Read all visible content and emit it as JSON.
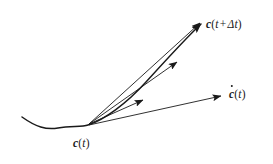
{
  "figure": {
    "background_color": "#ffffff",
    "stroke_color": "#1a1a1a",
    "width": 273,
    "height": 164
  },
  "labels": {
    "base_point": {
      "vector": "c",
      "open_paren": "(",
      "arg": "t",
      "close_paren": ")",
      "full_text": "c(t)"
    },
    "end_point": {
      "vector": "c",
      "open_paren": "(",
      "arg": "t",
      "operator": "+",
      "delta": "Δt",
      "close_paren": ")",
      "full_text": "c(t + Δt)"
    },
    "tangent": {
      "vector": "c",
      "accent": "dot",
      "open_paren": "(",
      "arg": "t",
      "close_paren": ")",
      "full_text": "ċ(t)"
    }
  },
  "geometry": {
    "origin": {
      "x": 88,
      "y": 125
    },
    "curve_path": "M 22 117 C 36 127, 46 130, 58 128 C 72 126, 82 127, 88 125 C 104 120, 126 104, 146 82 C 166 60, 186 38, 201 24",
    "secant_arrows": [
      {
        "name": "secant-long",
        "x1": 89,
        "y1": 124,
        "x2": 200,
        "y2": 23
      },
      {
        "name": "secant-mid",
        "x1": 89,
        "y1": 124,
        "x2": 177,
        "y2": 62
      },
      {
        "name": "secant-short",
        "x1": 89,
        "y1": 124,
        "x2": 143,
        "y2": 100
      }
    ],
    "tangent_arrow": {
      "name": "tangent-vector",
      "x1": 89,
      "y1": 125,
      "x2": 221,
      "y2": 96
    },
    "curve_arrowhead": {
      "x": 201,
      "y": 24,
      "angle": -55
    }
  }
}
